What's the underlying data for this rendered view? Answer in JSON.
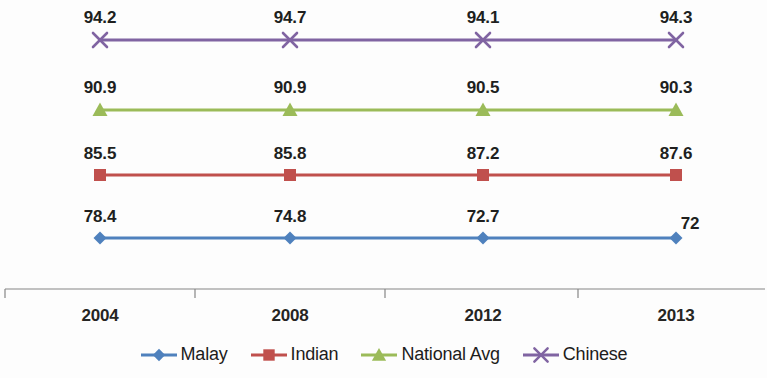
{
  "chart_data": {
    "type": "line",
    "title": "",
    "xlabel": "",
    "ylabel": "",
    "categories": [
      "2004",
      "2008",
      "2012",
      "2013"
    ],
    "grid": false,
    "legend_position": "bottom",
    "series": [
      {
        "name": "Malay",
        "color": "#4F81BD",
        "marker": "diamond",
        "values": [
          78.4,
          74.8,
          72.7,
          72
        ],
        "labels": [
          "78.4",
          "74.8",
          "72.7",
          "72"
        ]
      },
      {
        "name": "Indian",
        "color": "#C0504D",
        "marker": "square",
        "values": [
          85.5,
          85.8,
          87.2,
          87.6
        ],
        "labels": [
          "85.5",
          "85.8",
          "87.2",
          "87.6"
        ]
      },
      {
        "name": "National Avg",
        "color": "#9BBB59",
        "marker": "triangle",
        "values": [
          90.9,
          90.9,
          90.5,
          90.3
        ],
        "labels": [
          "90.9",
          "90.9",
          "90.5",
          "90.3"
        ]
      },
      {
        "name": "Chinese",
        "color": "#8064A2",
        "marker": "x",
        "values": [
          94.2,
          94.7,
          94.1,
          94.3
        ],
        "labels": [
          "94.2",
          "94.7",
          "94.1",
          "94.3"
        ]
      }
    ]
  },
  "axis": {
    "tick_labels": [
      "2004",
      "2008",
      "2012",
      "2013"
    ],
    "line_color": "#868686"
  },
  "legend": {
    "items": [
      {
        "label": "Malay",
        "color": "#4F81BD",
        "marker": "diamond"
      },
      {
        "label": "Indian",
        "color": "#C0504D",
        "marker": "square"
      },
      {
        "label": "National Avg",
        "color": "#9BBB59",
        "marker": "triangle"
      },
      {
        "label": "Chinese",
        "color": "#8064A2",
        "marker": "x"
      }
    ]
  }
}
